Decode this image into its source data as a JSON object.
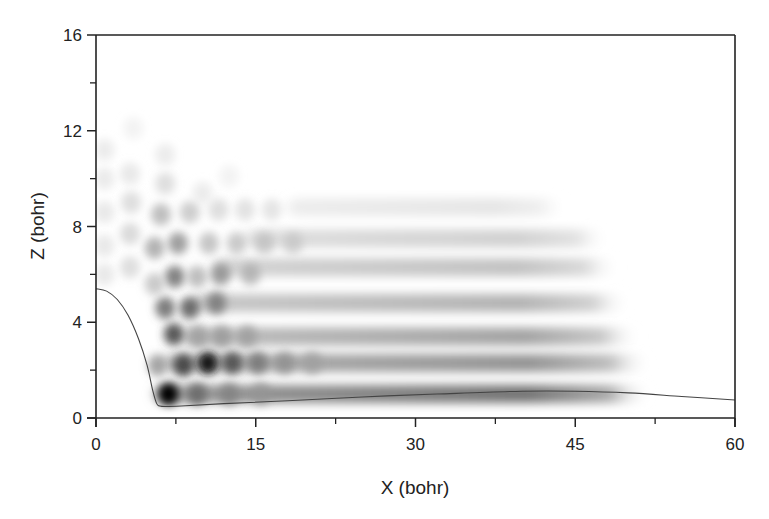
{
  "chart_data": {
    "type": "heatmap",
    "title": "",
    "xlabel": "X (bohr)",
    "ylabel": "Z (bohr)",
    "xlim": [
      0,
      60
    ],
    "ylim": [
      0,
      16
    ],
    "x_ticks": [
      0,
      15,
      30,
      45,
      60
    ],
    "x_minor_ticks": [
      7.5,
      22.5,
      37.5,
      52.5
    ],
    "y_ticks": [
      0,
      4,
      8,
      12,
      16
    ],
    "y_minor_ticks": [
      2,
      6,
      10,
      14
    ],
    "x_tick_labels": [
      "0",
      "15",
      "30",
      "45",
      "60"
    ],
    "y_tick_labels": [
      "0",
      "4",
      "8",
      "12",
      "16"
    ],
    "colormap": "grayscale (white = 0, black = max density)",
    "grid": false,
    "legend": "none",
    "bands": [
      {
        "z": 1.0,
        "x_start": 5.5,
        "x_end": 52,
        "intensity": 0.55
      },
      {
        "z": 2.3,
        "x_start": 6.5,
        "x_end": 52,
        "intensity": 0.42
      },
      {
        "z": 3.4,
        "x_start": 8,
        "x_end": 51,
        "intensity": 0.36
      },
      {
        "z": 4.8,
        "x_start": 9,
        "x_end": 50,
        "intensity": 0.3
      },
      {
        "z": 6.3,
        "x_start": 11,
        "x_end": 49,
        "intensity": 0.24
      },
      {
        "z": 7.5,
        "x_start": 14,
        "x_end": 48,
        "intensity": 0.18
      },
      {
        "z": 8.8,
        "x_start": 18,
        "x_end": 44,
        "intensity": 0.1
      }
    ],
    "blobs": [
      {
        "x": 6.8,
        "z": 1.0,
        "intensity": 1.0
      },
      {
        "x": 9.5,
        "z": 1.0,
        "intensity": 0.6
      },
      {
        "x": 12.5,
        "z": 1.0,
        "intensity": 0.5
      },
      {
        "x": 15.5,
        "z": 1.0,
        "intensity": 0.42
      },
      {
        "x": 5.8,
        "z": 2.2,
        "intensity": 0.45
      },
      {
        "x": 8.2,
        "z": 2.2,
        "intensity": 0.75
      },
      {
        "x": 10.5,
        "z": 2.3,
        "intensity": 0.9
      },
      {
        "x": 12.8,
        "z": 2.3,
        "intensity": 0.7
      },
      {
        "x": 15.2,
        "z": 2.3,
        "intensity": 0.55
      },
      {
        "x": 17.7,
        "z": 2.3,
        "intensity": 0.45
      },
      {
        "x": 20.3,
        "z": 2.3,
        "intensity": 0.38
      },
      {
        "x": 7.3,
        "z": 3.5,
        "intensity": 0.72
      },
      {
        "x": 9.6,
        "z": 3.4,
        "intensity": 0.4
      },
      {
        "x": 11.8,
        "z": 3.4,
        "intensity": 0.42
      },
      {
        "x": 14.2,
        "z": 3.4,
        "intensity": 0.4
      },
      {
        "x": 6.5,
        "z": 4.6,
        "intensity": 0.6
      },
      {
        "x": 8.8,
        "z": 4.6,
        "intensity": 0.65
      },
      {
        "x": 11.3,
        "z": 4.8,
        "intensity": 0.55
      },
      {
        "x": 7.4,
        "z": 5.9,
        "intensity": 0.58
      },
      {
        "x": 9.5,
        "z": 5.9,
        "intensity": 0.35
      },
      {
        "x": 11.7,
        "z": 6.0,
        "intensity": 0.48
      },
      {
        "x": 14.5,
        "z": 6.0,
        "intensity": 0.35
      },
      {
        "x": 5.5,
        "z": 5.6,
        "intensity": 0.3
      },
      {
        "x": 5.5,
        "z": 7.1,
        "intensity": 0.4
      },
      {
        "x": 7.7,
        "z": 7.3,
        "intensity": 0.48
      },
      {
        "x": 10.6,
        "z": 7.3,
        "intensity": 0.32
      },
      {
        "x": 13.2,
        "z": 7.3,
        "intensity": 0.3
      },
      {
        "x": 15.8,
        "z": 7.3,
        "intensity": 0.28
      },
      {
        "x": 18.5,
        "z": 7.3,
        "intensity": 0.25
      },
      {
        "x": 6.1,
        "z": 8.5,
        "intensity": 0.35
      },
      {
        "x": 8.8,
        "z": 8.6,
        "intensity": 0.28
      },
      {
        "x": 11.5,
        "z": 8.7,
        "intensity": 0.2
      },
      {
        "x": 14,
        "z": 8.7,
        "intensity": 0.18
      },
      {
        "x": 16.5,
        "z": 8.7,
        "intensity": 0.16
      },
      {
        "x": 3.2,
        "z": 6.3,
        "intensity": 0.2
      },
      {
        "x": 3.2,
        "z": 7.7,
        "intensity": 0.22
      },
      {
        "x": 3.3,
        "z": 9.0,
        "intensity": 0.2
      },
      {
        "x": 6.5,
        "z": 9.8,
        "intensity": 0.2
      },
      {
        "x": 3.2,
        "z": 10.2,
        "intensity": 0.14
      },
      {
        "x": 6.5,
        "z": 11.0,
        "intensity": 0.12
      },
      {
        "x": 10.0,
        "z": 9.4,
        "intensity": 0.12
      },
      {
        "x": 12.5,
        "z": 10.1,
        "intensity": 0.08
      },
      {
        "x": 0.8,
        "z": 11.2,
        "intensity": 0.12
      },
      {
        "x": 0.8,
        "z": 10.0,
        "intensity": 0.13
      },
      {
        "x": 0.8,
        "z": 8.6,
        "intensity": 0.14
      },
      {
        "x": 0.8,
        "z": 7.2,
        "intensity": 0.14
      },
      {
        "x": 0.8,
        "z": 6.0,
        "intensity": 0.14
      },
      {
        "x": 3.5,
        "z": 12.1,
        "intensity": 0.08
      }
    ],
    "boundary_curve": {
      "x": [
        0,
        1,
        2,
        3,
        4,
        4.8,
        5.3,
        5.7,
        6.0,
        6.5,
        8,
        12,
        18,
        25,
        32,
        40,
        45,
        50,
        55,
        60
      ],
      "z": [
        5.4,
        5.3,
        4.95,
        4.3,
        3.3,
        2.2,
        1.2,
        0.6,
        0.5,
        0.48,
        0.5,
        0.6,
        0.72,
        0.88,
        1.0,
        1.12,
        1.12,
        1.05,
        0.9,
        0.75
      ]
    }
  }
}
